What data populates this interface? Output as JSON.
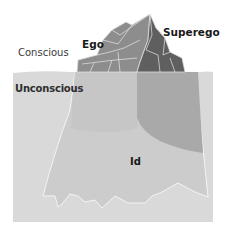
{
  "diagram": {
    "type": "iceberg-model",
    "regions": {
      "above_water": {
        "label": "Conscious"
      },
      "below_water": {
        "label": "Unconscious"
      }
    },
    "parts": [
      {
        "id": "ego",
        "label": "Ego"
      },
      {
        "id": "superego",
        "label": "Superego"
      },
      {
        "id": "id",
        "label": "Id"
      }
    ]
  },
  "colors": {
    "background": "#ffffff",
    "water": "#d9d9d9",
    "ego_above": "#8c8c8c",
    "superego_above": "#5e5e5e",
    "ego_below": "#c4c4c4",
    "superego_below": "#a8a8a8",
    "id_below": "#cccccc",
    "outline": "#f2f2f2"
  }
}
